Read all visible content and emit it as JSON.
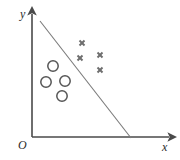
{
  "figure": {
    "background_color": "#ffffff",
    "axes": {
      "y_label": "y",
      "x_label": "x",
      "origin_label": "O",
      "axis_color": "#4a4a4a",
      "x_axis": {
        "x1": 32,
        "y1": 137,
        "x2": 172,
        "y2": 137
      },
      "y_axis": {
        "x1": 32,
        "y1": 137,
        "x2": 32,
        "y2": 11
      }
    },
    "separator_line": {
      "name": "decision-boundary",
      "color": "#7a7a7a",
      "x1": 40,
      "y1": 21,
      "x2": 131,
      "y2": 138
    }
  },
  "chart_data": {
    "type": "scatter",
    "title": "",
    "xlabel": "x",
    "ylabel": "y",
    "grid": false,
    "legend": "none",
    "xlim": [
      0,
      180
    ],
    "ylim": [
      0,
      160
    ],
    "annotations": [
      "O"
    ],
    "series": [
      {
        "name": "circles",
        "marker": "circle",
        "color": "#555555",
        "radius": 5.2,
        "points": [
          {
            "x": 53,
            "y": 66
          },
          {
            "x": 46,
            "y": 82
          },
          {
            "x": 65,
            "y": 81
          },
          {
            "x": 62,
            "y": 96
          }
        ]
      },
      {
        "name": "crosses",
        "marker": "x",
        "color": "#6e6e6e",
        "size": 5.0,
        "points": [
          {
            "x": 82,
            "y": 43
          },
          {
            "x": 80,
            "y": 58
          },
          {
            "x": 100,
            "y": 55
          },
          {
            "x": 100,
            "y": 70
          }
        ]
      }
    ]
  }
}
